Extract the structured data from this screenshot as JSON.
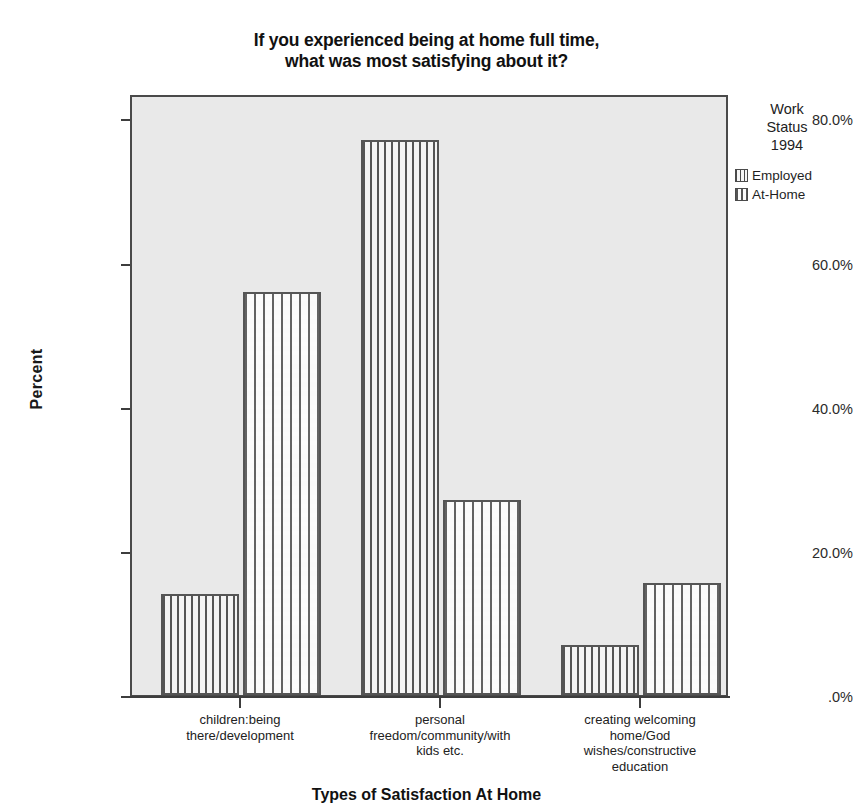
{
  "chart_data": {
    "type": "bar",
    "title": "If you experienced being at home full time, what was most satisfying about it?",
    "title_lines": [
      "If you experienced being at home full time,",
      "what was most satisfying about it?"
    ],
    "xlabel": "Types of Satisfaction At Home",
    "ylabel": "Percent",
    "ylim": [
      0,
      85
    ],
    "grid": false,
    "legend_position": "right",
    "legend_title": "Work Status 1994",
    "legend_title_lines": [
      "Work",
      "Status",
      "1994"
    ],
    "categories": [
      "children:being there/development",
      "personal freedom/community/with kids etc.",
      "creating welcoming home/God wishes/constructive education"
    ],
    "category_lines": [
      [
        "children:being",
        "there/development"
      ],
      [
        "personal",
        "freedom/community/with",
        "kids etc."
      ],
      [
        "creating welcoming",
        "home/God",
        "wishes/constructive",
        "education"
      ]
    ],
    "series": [
      {
        "name": "Employed",
        "pattern": "vertical-stripes",
        "values": [
          14.3,
          78.6,
          7.1
        ]
      },
      {
        "name": "At-Home",
        "pattern": "dotted-grid",
        "values": [
          57.1,
          27.6,
          15.8
        ]
      }
    ],
    "y_ticks": [
      {
        "value": 0,
        "label": ".0%"
      },
      {
        "value": 20,
        "label": "20.0%"
      },
      {
        "value": 40,
        "label": "40.0%"
      },
      {
        "value": 60,
        "label": "60.0%"
      },
      {
        "value": 80,
        "label": "80.0%"
      }
    ],
    "colors": {
      "plot_background": "#e9e9e9",
      "page_background": "#ffffff",
      "axis": "#3d3d3d",
      "bar_border": "#555555",
      "bar_fill": "#f4f4f4",
      "text": "#1a1a1a"
    }
  }
}
